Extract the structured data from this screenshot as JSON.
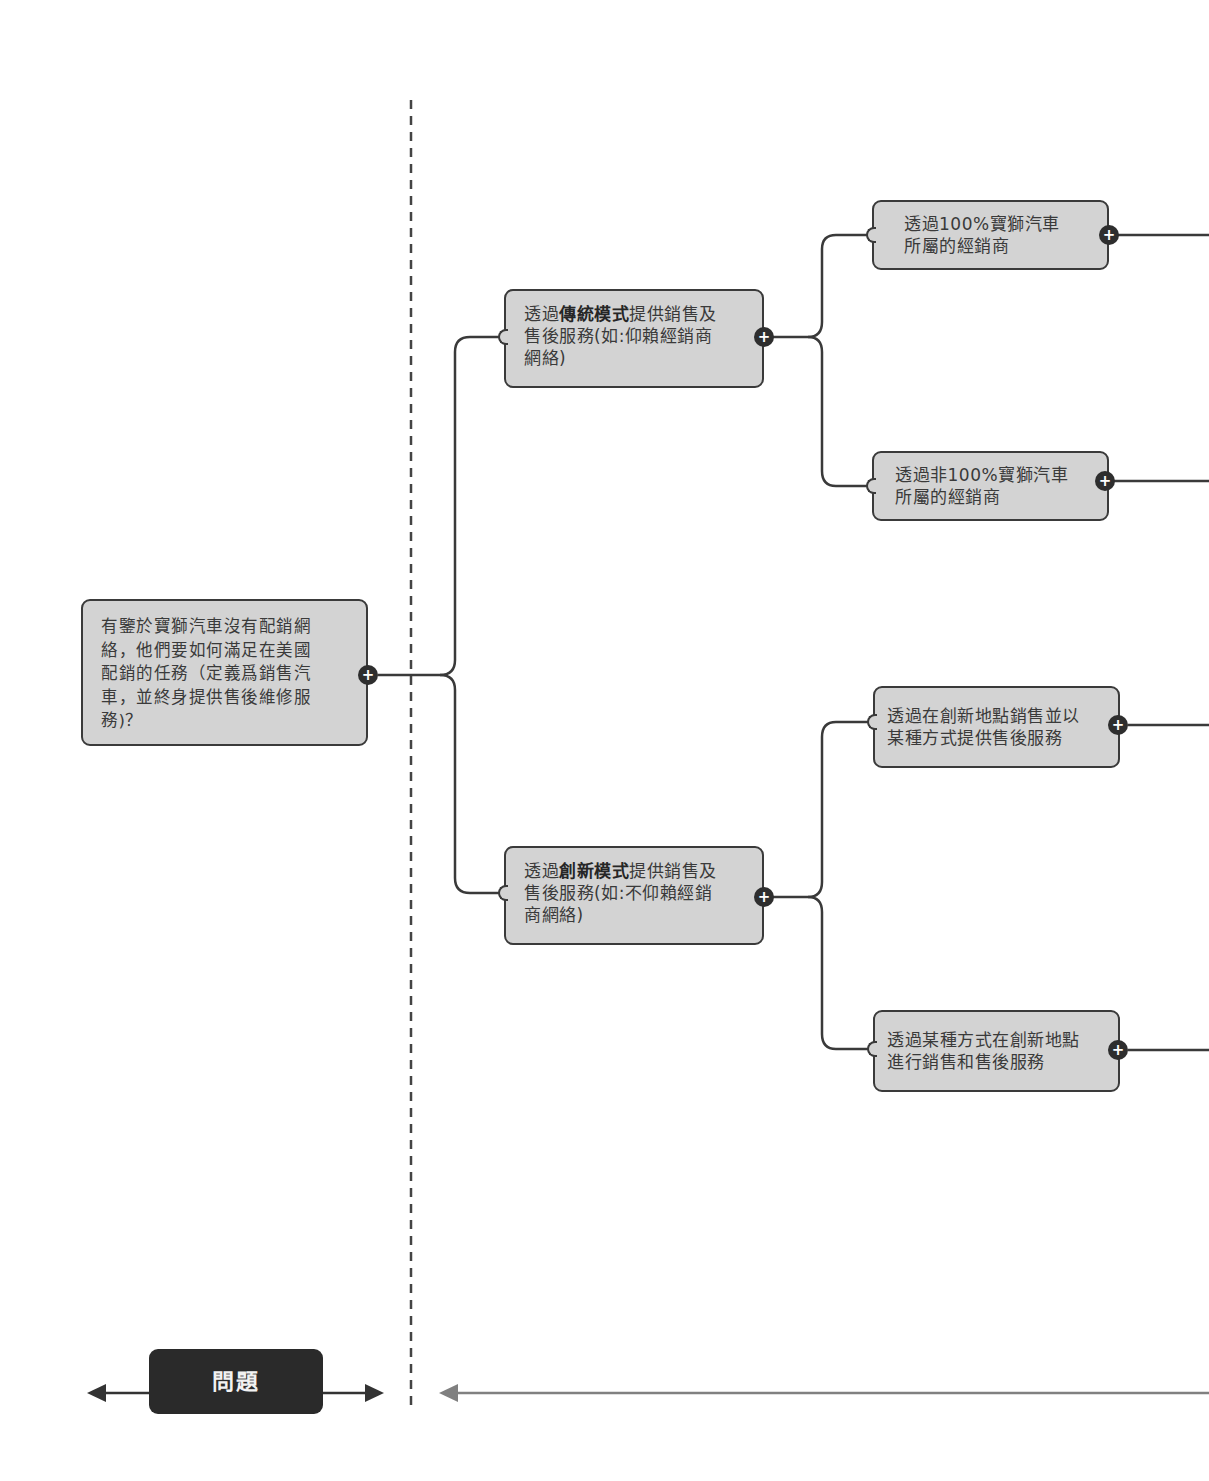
{
  "diagram": {
    "type": "issue-tree",
    "root": {
      "text": "有鑒於寶獅汽車沒有配銷網絡，他們要如何滿足在美國配銷的任務（定義爲銷售汽車，並終身提供售後維修服務)？",
      "lines": [
        "有鑒於寶獅汽車沒有配銷網",
        "絡，他們要如何滿足在美國",
        "配銷的任務（定義爲銷售汽",
        "車，並終身提供售後維修服",
        "務)？"
      ],
      "expand_icon": "plus-icon"
    },
    "branches": [
      {
        "id": "traditional",
        "prefix": "透過",
        "bold": "傳統模式",
        "line1_suffix": "提供銷售及",
        "line2": "售後服務(如:仰賴經銷商",
        "line3": "網絡)",
        "expand_icon": "plus-icon",
        "children": [
          {
            "lines": [
              "透過100%寶獅汽車",
              "所屬的經銷商"
            ],
            "expand_icon": "plus-icon"
          },
          {
            "lines": [
              "透過非100%寶獅汽車",
              "所屬的經銷商"
            ],
            "expand_icon": "plus-icon"
          }
        ]
      },
      {
        "id": "innovative",
        "prefix": "透過",
        "bold": "創新模式",
        "line1_suffix": "提供銷售及",
        "line2": "售後服務(如:不仰賴經銷",
        "line3": "商網絡)",
        "expand_icon": "plus-icon",
        "children": [
          {
            "lines": [
              "透過在創新地點銷售並以",
              "某種方式提供售後服務"
            ],
            "expand_icon": "plus-icon"
          },
          {
            "lines": [
              "透過某種方式在創新地點",
              "進行銷售和售後服務"
            ],
            "expand_icon": "plus-icon"
          }
        ]
      }
    ]
  },
  "footer": {
    "section_label": "問題",
    "arrows": [
      "arrow-left-icon",
      "arrow-right-icon",
      "arrow-left-icon"
    ]
  },
  "colors": {
    "node_fill": "#d3d3d3",
    "node_border": "#3a3a3a",
    "connector": "#3a3a3a",
    "label_fill": "#2a2a2a",
    "label_text": "#f2f2f2",
    "divider": "#444444",
    "footer_arrow_right": "#808080"
  },
  "plus_symbol": "+"
}
